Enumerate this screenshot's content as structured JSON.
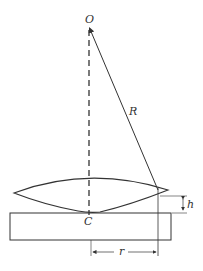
{
  "figure": {
    "labels": {
      "center_of_curvature": "O",
      "radius": "R",
      "contact_point": "C",
      "gap_height": "h",
      "ring_radius": "r"
    },
    "caption_clipped": ""
  },
  "colors": {
    "stroke": "#333333",
    "background": "#ffffff"
  }
}
